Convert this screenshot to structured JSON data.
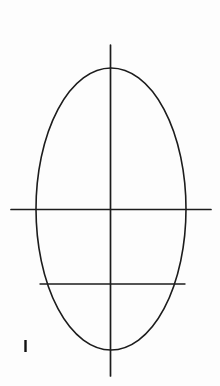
{
  "page": {
    "width": 220,
    "height": 386,
    "background_color": "#fdfdfd",
    "ink_color": "#1c1c1c"
  },
  "figure": {
    "name": "ellipse-with-axes",
    "ellipse": {
      "label": "ellipse-outline",
      "cx": 111,
      "cy": 209,
      "rx": 75,
      "ry": 141,
      "stroke_width": 1.6,
      "stroke_color": "#1c1c1c"
    },
    "vertical_axis": {
      "label": "vertical-axis-line",
      "x": 110.5,
      "y1": 45,
      "y2": 376,
      "stroke_width": 1.7,
      "stroke_color": "#1c1c1c"
    },
    "horizontal_axis": {
      "label": "horizontal-axis-line",
      "y": 209.5,
      "x1": 11,
      "x2": 211,
      "stroke_width": 1.7,
      "stroke_color": "#1c1c1c"
    },
    "lower_chord": {
      "label": "lower-horizontal-chord",
      "y": 284,
      "x1": 40,
      "x2": 185,
      "stroke_width": 1.4,
      "stroke_color": "#1c1c1c"
    },
    "tick_mark": {
      "label": "lower-left-tick-mark",
      "x": 25.5,
      "y1": 340,
      "y2": 352,
      "stroke_width": 2.4,
      "stroke_color": "#111111"
    }
  }
}
